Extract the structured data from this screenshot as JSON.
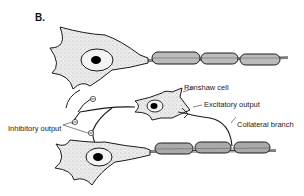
{
  "panel_label": "B.",
  "labels": {
    "renshaw_cell": "Renshaw cell",
    "excitatory_output": "Excitatory output",
    "collateral_branch": "Collateral branch",
    "inhibitory_output": "Inhibitory output"
  },
  "synapse_symbol": "⊖",
  "colors": {
    "stroke": "#1a1a1a",
    "cell_fill": "#e6e6e6",
    "myelin_fill": "#b8b8b8",
    "nucleus": "#000000"
  }
}
